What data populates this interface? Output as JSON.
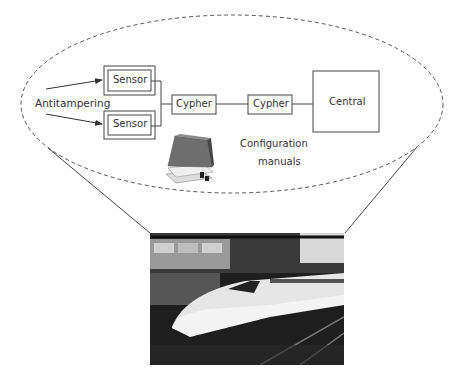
{
  "diagram": {
    "annotation": "Antitampering",
    "nodes": {
      "sensor_top": "Sensor",
      "sensor_bottom": "Sensor",
      "cypher_1": "Cypher",
      "cypher_2": "Cypher",
      "central": "Central"
    },
    "config_label_line1": "Configuration",
    "config_label_line2": "manuals",
    "icons": {
      "manuals": "book-stack-icon",
      "photo": "bullet-train-photo"
    },
    "colors": {
      "line": "#444444",
      "dash": "#555555",
      "text": "#333333"
    }
  }
}
